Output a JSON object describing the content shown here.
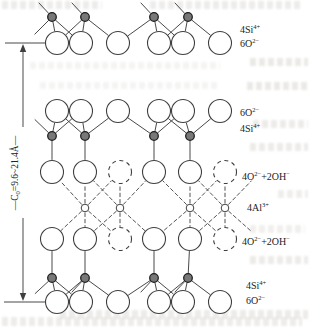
{
  "figure": {
    "width": 310,
    "height": 329,
    "background": "#ffffff",
    "ink": "#3f3f3f",
    "text_color": "#222222",
    "si_fill": "#787878",
    "o_radius": 11.5,
    "si_radius": 4.3,
    "al_radius": 3.8,
    "o_xs": [
      57,
      81,
      118,
      159,
      183,
      220
    ],
    "top_si_xs": [
      52,
      85,
      154,
      188
    ],
    "mid_si_xs": [
      52,
      85,
      154,
      190
    ],
    "bottom_si_xs": [
      52,
      85,
      154,
      188
    ],
    "oct_solid_xs": [
      52,
      85,
      154,
      190
    ],
    "oct_dashed_xs": [
      120,
      225
    ],
    "al_xs": [
      85,
      120,
      190,
      225
    ],
    "al_diag_left_xs": [
      52,
      85,
      154,
      190
    ],
    "al_vert_xs": [
      85,
      120,
      190,
      225
    ],
    "al_diag_right_xs": [
      120,
      154,
      225,
      260
    ],
    "row_y": {
      "top_si": 17,
      "top_o": 43,
      "upper_o": 111,
      "upper_si": 136,
      "oct_top": 172,
      "al": 208,
      "oct_bot": 239,
      "lower_si": 278,
      "bottom_o": 302
    },
    "bond_map": [
      [
        0,
        1
      ],
      [
        0,
        1,
        2
      ],
      [
        2,
        3,
        4
      ],
      [
        3,
        4,
        5
      ]
    ],
    "virtual_left_o_x": 26,
    "virtual_right_o_x": 260
  },
  "dimension": {
    "line_x": 23,
    "top_tick_y": 43,
    "bottom_tick_y": 302,
    "gap_top_y": 127,
    "gap_bottom_y": 218,
    "runs": [
      {
        "t": "—C"
      },
      {
        "sub": "0"
      },
      {
        "t": "=9.6~21.4Å—"
      }
    ]
  },
  "side_labels": [
    {
      "name": "label-4si-top",
      "x": 240,
      "y": 30,
      "runs": [
        {
          "t": "4Si"
        },
        {
          "sup": "4+"
        }
      ]
    },
    {
      "name": "label-6o-top",
      "x": 240,
      "y": 44,
      "runs": [
        {
          "t": "6O"
        },
        {
          "sup": "2−"
        }
      ]
    },
    {
      "name": "label-6o-upper",
      "x": 240,
      "y": 113,
      "runs": [
        {
          "t": "6O"
        },
        {
          "sup": "2−"
        }
      ]
    },
    {
      "name": "label-4si-upper",
      "x": 240,
      "y": 129,
      "runs": [
        {
          "t": "4Si"
        },
        {
          "sup": "4+"
        }
      ]
    },
    {
      "name": "label-4o-2oh-upper",
      "x": 242,
      "y": 177,
      "runs": [
        {
          "t": "4O"
        },
        {
          "sup": "2−"
        },
        {
          "t": "+2OH"
        },
        {
          "sup": "−"
        }
      ]
    },
    {
      "name": "label-4al",
      "x": 247,
      "y": 208,
      "runs": [
        {
          "t": "4Al"
        },
        {
          "sup": "3+"
        }
      ]
    },
    {
      "name": "label-4o-2oh-lower",
      "x": 242,
      "y": 242,
      "runs": [
        {
          "t": "4O"
        },
        {
          "sup": "2−"
        },
        {
          "t": "+2OH"
        },
        {
          "sup": "−"
        }
      ]
    },
    {
      "name": "label-4si-bottom",
      "x": 246,
      "y": 286,
      "runs": [
        {
          "t": "4Si"
        },
        {
          "sup": "4+"
        }
      ]
    },
    {
      "name": "label-6o-bottom",
      "x": 246,
      "y": 301,
      "runs": [
        {
          "t": "6O"
        },
        {
          "sup": "2−"
        }
      ]
    }
  ]
}
